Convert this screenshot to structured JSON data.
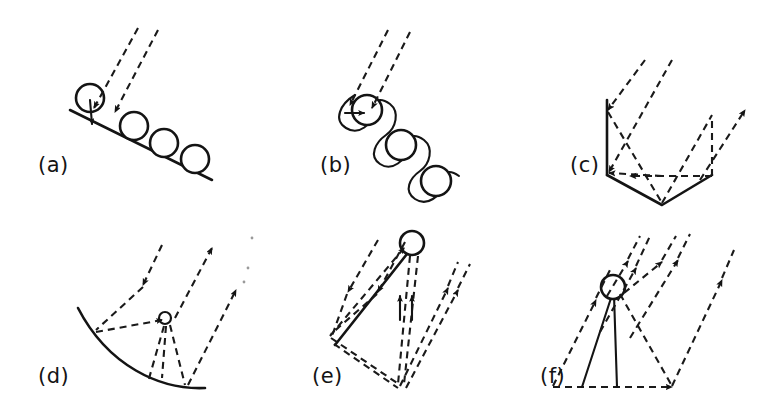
{
  "figure": {
    "background_color": "#ffffff",
    "ink_color": "#141414",
    "width": 782,
    "height": 414,
    "panel_count": 6,
    "layout": "2 rows x 3 columns"
  },
  "panels": [
    {
      "id": "a",
      "label": "(a)",
      "label_x": 38,
      "label_y": 172,
      "description": "Flat inclined planar surface with a row of four open circles resting on it; two parallel dashed incident rays arrive from the upper right and a short solid arrow points down into the surface at the first circle.",
      "surface_type": "flat-inclined-line",
      "circle_count": 4,
      "incident_ray_count": 2,
      "reflected_ray_count": 0
    },
    {
      "id": "b",
      "label": "(b)",
      "label_x": 320,
      "label_y": 172,
      "description": "Scalloped looping curve (coiled/spring-like) threading through three open circles descending to the lower right; two parallel dashed incident rays arrive from the upper right with a short solid arrow entering the first circle from the left.",
      "surface_type": "scalloped-coiled-curve",
      "circle_count": 3,
      "incident_ray_count": 2,
      "reflected_ray_count": 0
    },
    {
      "id": "c",
      "label": "(c)",
      "label_x": 570,
      "label_y": 172,
      "description": "V-shaped groove with a solid vertical left wall; two dashed incident rays enter from upper left, reflect off the vertical wall and the V floor, and two dashed rays exit to the upper right. A horizontal dashed ray with a left-pointing arrowhead runs across the groove mouth.",
      "surface_type": "v-groove-with-vertical-wall",
      "circle_count": 0,
      "incident_ray_count": 2,
      "reflected_ray_count": 2
    },
    {
      "id": "d",
      "label": "(d)",
      "label_x": 38,
      "label_y": 383,
      "description": "Concave circular-arc surface; a single dashed incident ray arrives from the upper right onto a small open circle (focal point) above the arc, and dashed rays fan from the focus down to the arc and out to the upper right as two parallel reflected rays.",
      "surface_type": "concave-arc",
      "circle_count": 1,
      "incident_ray_count": 1,
      "reflected_ray_count": 2
    },
    {
      "id": "e",
      "label": "(e)",
      "label_x": 312,
      "label_y": 383,
      "description": "Triangular ridge formed by a solid slanted ramp rising to an open circle at the apex; two dashed incident rays arrive from the upper left, with dashed paths reflecting down the far side and two dashed rays exiting to the upper right plus two short vertical arrows beneath the apex.",
      "surface_type": "triangular-ridge",
      "circle_count": 1,
      "incident_ray_count": 2,
      "reflected_ray_count": 2
    },
    {
      "id": "f",
      "label": "(f)",
      "label_x": 540,
      "label_y": 383,
      "description": "Open circle supported by two solid converging lines standing on a horizontal dashed baseline; four evenly spaced parallel dashed rays with arrowheads run up to the right, with dashed reflected paths meeting at the circle.",
      "surface_type": "pillar-on-baseline",
      "circle_count": 1,
      "incident_ray_count": 4,
      "reflected_ray_count": 2
    }
  ]
}
